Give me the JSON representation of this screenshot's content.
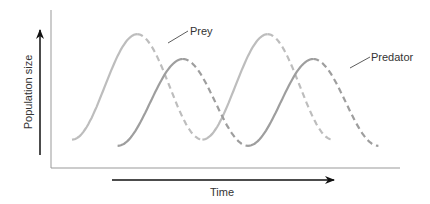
{
  "chart_data": {
    "type": "line",
    "title": "",
    "xlabel": "Time",
    "ylabel": "Population size",
    "grid": false,
    "series": [
      {
        "name": "Prey",
        "color": "#bdbdbd",
        "description": "Oscillating population; rising phase solid, falling phase dashed",
        "x": [
          0,
          1,
          2,
          3,
          4,
          5,
          6,
          7,
          8,
          9,
          10
        ],
        "cycles": [
          {
            "rise_start": 0.0,
            "peak": 2.0,
            "trough": 4.0
          },
          {
            "rise_start": 4.0,
            "peak": 6.0,
            "trough": 8.0
          }
        ],
        "min": 0.1,
        "max": 0.95
      },
      {
        "name": "Predator",
        "color": "#9e9e9e",
        "description": "Oscillating population lagging prey; rising phase solid, falling phase dashed",
        "cycles": [
          {
            "rise_start": 1.4,
            "peak": 3.4,
            "trough": 5.4
          },
          {
            "rise_start": 5.4,
            "peak": 7.4,
            "trough": 9.4
          }
        ],
        "min": 0.05,
        "max": 0.75
      }
    ],
    "annotations": [
      {
        "text": "Prey",
        "target": "Prey"
      },
      {
        "text": "Predator",
        "target": "Predator"
      }
    ]
  }
}
